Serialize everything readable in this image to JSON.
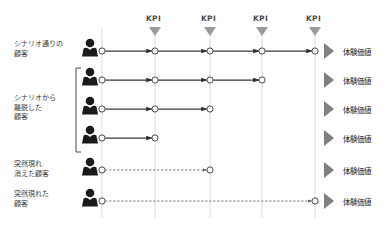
{
  "diagram": {
    "colors": {
      "gridline": "#d9d9d9",
      "journey_line": "#3a3a3a",
      "dashed_line": "#6b6b6b",
      "node_fill": "#ffffff",
      "node_stroke": "#4a4a4a",
      "person": "#1a1a1a",
      "chevron": "#808080",
      "kpi_marker": "#9a9a9a",
      "text": "#3b3b3b",
      "bracket": "#4a4a4a"
    }
  },
  "kpi_markers": [
    {
      "label": "KPI",
      "x": 155
    },
    {
      "label": "KPI",
      "x": 210
    },
    {
      "label": "KPI",
      "x": 262
    },
    {
      "label": "KPI",
      "x": 315
    }
  ],
  "start_line": {
    "x": 102
  },
  "row_labels": [
    {
      "id": "scenario-as-planned",
      "text": "シナリオ通りの\n顧客",
      "x": 14,
      "y": 40
    },
    {
      "id": "scenario-dropout",
      "text": "シナリオから\n離脱した\n顧客",
      "x": 14,
      "y": 94
    },
    {
      "id": "appeared-and-vanished",
      "text": "突然現れ\n消えた顧客",
      "x": 14,
      "y": 160
    },
    {
      "id": "suddenly-appeared",
      "text": "突然現れた\n顧客",
      "x": 14,
      "y": 190
    }
  ],
  "rows": [
    {
      "id": "row-1",
      "y": 51,
      "style": "solid",
      "nodes_x": [
        102,
        155,
        210,
        262,
        315
      ],
      "end_x": 315,
      "value_label": "体験価値"
    },
    {
      "id": "row-2",
      "y": 80,
      "style": "solid",
      "nodes_x": [
        102,
        155,
        210,
        262
      ],
      "end_x": 262,
      "value_label": "体験価値"
    },
    {
      "id": "row-3",
      "y": 109,
      "style": "solid",
      "nodes_x": [
        102,
        155,
        210
      ],
      "end_x": 210,
      "value_label": "体験価値"
    },
    {
      "id": "row-4",
      "y": 138,
      "style": "solid",
      "nodes_x": [
        102,
        155
      ],
      "end_x": 155,
      "value_label": "体験価値"
    },
    {
      "id": "row-5",
      "y": 170,
      "style": "dashed",
      "nodes_x": [
        102,
        210
      ],
      "end_x": 210,
      "value_label": "体験価値"
    },
    {
      "id": "row-6",
      "y": 201,
      "style": "dashed",
      "nodes_x": [
        102,
        315
      ],
      "end_x": 315,
      "value_label": "体験価値"
    }
  ],
  "person_icons": [
    {
      "id": "person-1",
      "x": 90,
      "y": 51
    },
    {
      "id": "person-2",
      "x": 90,
      "y": 80
    },
    {
      "id": "person-3",
      "x": 90,
      "y": 109
    },
    {
      "id": "person-4",
      "x": 90,
      "y": 138
    },
    {
      "id": "person-5",
      "x": 90,
      "y": 170
    },
    {
      "id": "person-6",
      "x": 90,
      "y": 201
    }
  ],
  "group_bracket": {
    "id": "dropout-group-bracket",
    "x": 76,
    "y_top": 68,
    "y_bottom": 152
  },
  "value_labels_x": 343,
  "chevron_x": 324
}
